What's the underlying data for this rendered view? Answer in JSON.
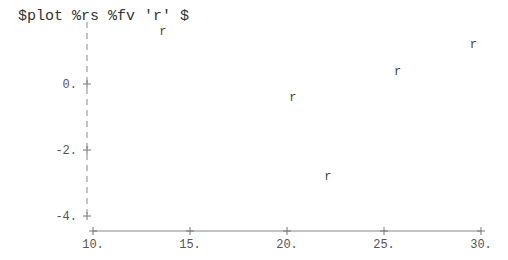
{
  "command": {
    "text": "$plot %rs %fv 'r' $"
  },
  "chart_data": {
    "type": "scatter",
    "title": "",
    "xlabel": "",
    "ylabel": "",
    "marker": "r",
    "x": [
      13.6,
      20.3,
      22.1,
      25.7,
      29.6
    ],
    "y": [
      1.6,
      -0.4,
      -2.8,
      0.4,
      1.2
    ],
    "xlim": [
      10,
      30
    ],
    "ylim": [
      -4,
      1.8
    ],
    "x_ticks": [
      "10.",
      "15.",
      "20.",
      "25.",
      "30."
    ],
    "y_ticks": [
      "0.",
      "-2.",
      "-4."
    ],
    "grid": false,
    "legend": null
  }
}
